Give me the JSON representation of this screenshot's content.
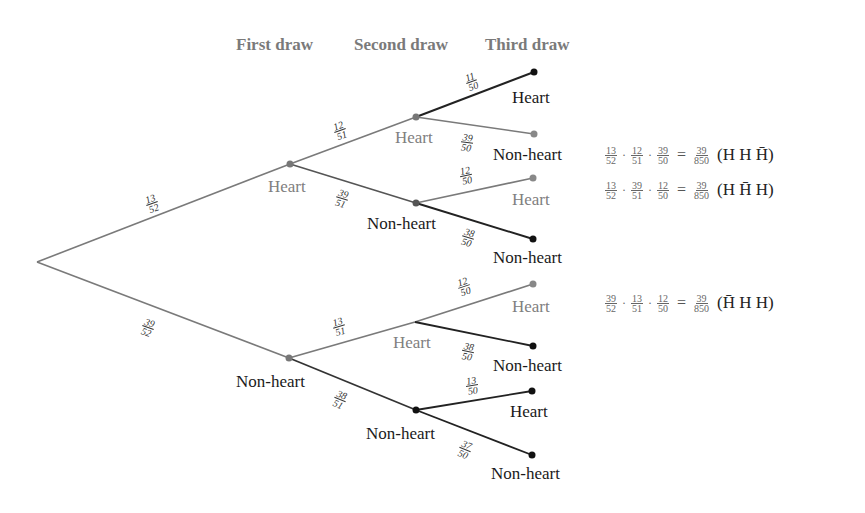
{
  "headers": {
    "first": "First draw",
    "second": "Second draw",
    "third": "Third draw"
  },
  "tree": {
    "root": {
      "x": 37,
      "y": 262
    },
    "level1": [
      {
        "label": "Heart",
        "prob": "13/52",
        "num": "13",
        "den": "52",
        "color": "gray"
      },
      {
        "label": "Non-heart",
        "prob": "39/52",
        "num": "39",
        "den": "52",
        "color": "dark"
      }
    ],
    "level2": [
      {
        "parent": "Heart",
        "label": "Heart",
        "num": "12",
        "den": "51",
        "color": "gray"
      },
      {
        "parent": "Heart",
        "label": "Non-heart",
        "num": "39",
        "den": "51",
        "color": "dark"
      },
      {
        "parent": "Non-heart",
        "label": "Heart",
        "num": "13",
        "den": "51",
        "color": "gray"
      },
      {
        "parent": "Non-heart",
        "label": "Non-heart",
        "num": "38",
        "den": "51",
        "color": "dark"
      }
    ],
    "level3": [
      {
        "label": "Heart",
        "num": "11",
        "den": "50",
        "color": "dark"
      },
      {
        "label": "Non-heart",
        "num": "39",
        "den": "50",
        "color": "dark"
      },
      {
        "label": "Heart",
        "num": "12",
        "den": "50",
        "color": "gray"
      },
      {
        "label": "Non-heart",
        "num": "38",
        "den": "50",
        "color": "dark"
      },
      {
        "label": "Heart",
        "num": "12",
        "den": "50",
        "color": "gray"
      },
      {
        "label": "Non-heart",
        "num": "38",
        "den": "50",
        "color": "dark"
      },
      {
        "label": "Heart",
        "num": "13",
        "den": "50",
        "color": "dark"
      },
      {
        "label": "Non-heart",
        "num": "37",
        "den": "50",
        "color": "dark"
      }
    ]
  },
  "equations": [
    {
      "f1n": "13",
      "f1d": "52",
      "f2n": "12",
      "f2d": "51",
      "f3n": "39",
      "f3d": "50",
      "rn": "39",
      "rd": "850",
      "seq": "(H H H̄)"
    },
    {
      "f1n": "13",
      "f1d": "52",
      "f2n": "39",
      "f2d": "51",
      "f3n": "12",
      "f3d": "50",
      "rn": "39",
      "rd": "850",
      "seq": "(H H̄ H)"
    },
    {
      "f1n": "39",
      "f1d": "52",
      "f2n": "13",
      "f2d": "51",
      "f3n": "12",
      "f3d": "50",
      "rn": "39",
      "rd": "850",
      "seq": "(H̄ H H)"
    }
  ],
  "symbols": {
    "dot": "·",
    "equals": "="
  },
  "colors": {
    "dark": "#1a1a1a",
    "gray": "#888888",
    "header": "#7a7a7a"
  }
}
